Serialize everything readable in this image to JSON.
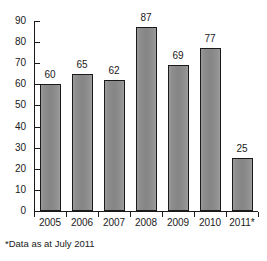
{
  "chart_data": {
    "type": "bar",
    "title": "",
    "subtitle": "",
    "xlabel": "",
    "ylabel": "",
    "categories": [
      "2005",
      "2006",
      "2007",
      "2008",
      "2009",
      "2010",
      "2011*"
    ],
    "values": [
      60,
      65,
      62,
      87,
      69,
      77,
      25
    ],
    "value_labels": [
      "60",
      "65",
      "62",
      "87",
      "69",
      "77",
      "25"
    ],
    "ylim": [
      0,
      90
    ],
    "ytick_step": 10,
    "ytick_labels": [
      "0",
      "10",
      "20",
      "30",
      "40",
      "50",
      "60",
      "70",
      "80",
      "90"
    ],
    "ytick_values": [
      0,
      10,
      20,
      30,
      40,
      50,
      60,
      70,
      80,
      90
    ],
    "grid": false,
    "legend": null,
    "legend_position": "none",
    "annotations": [
      "*Data as at July 2011"
    ],
    "bar_fill_color": "#8a8a8a",
    "bar_border_color": "#1a1a1a",
    "axis_color": "#1a1a1a",
    "background_color": "#ffffff"
  },
  "footnote": {
    "text": "*Data as at July 2011"
  }
}
